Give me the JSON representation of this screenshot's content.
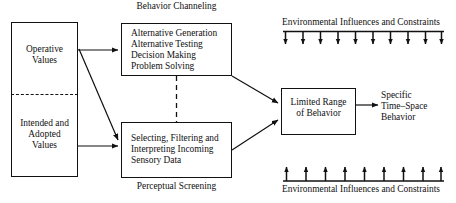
{
  "diagram": {
    "colors": {
      "stroke": "#111111",
      "background": "#ffffff",
      "text": "#111111"
    },
    "left_box": {
      "upper_label": "Operative\nValues",
      "lower_label": "Intended and\nAdopted\nValues",
      "divider": "dashed"
    },
    "top_process_box": {
      "caption": "Behavior Channeling",
      "lines": [
        "Alternative Generation",
        "Alternative Testing",
        "Decision Making",
        "Problem Solving"
      ],
      "text": "Alternative Generation\nAlternative Testing\nDecision Making\nProblem Solving"
    },
    "bottom_process_box": {
      "caption": "Perceptual Screening",
      "lines": [
        "Selecting, Filtering and",
        "Interpreting Incoming",
        "Sensory Data"
      ],
      "text": "Selecting, Filtering and\nInterpreting Incoming\nSensory Data"
    },
    "outcome_box": {
      "label": "Limited Range\nof Behavior"
    },
    "final_output": {
      "label": "Specific\nTime–Space\nBehavior"
    },
    "environment_top": {
      "label": "Environmental Influences and Constraints",
      "arrow_direction": "down",
      "arrow_count": 10
    },
    "environment_bottom": {
      "label": "Environmental Influences and Constraints",
      "arrow_direction": "up",
      "arrow_count": 9
    },
    "connectors": [
      {
        "name": "operative-to-behavior-channeling",
        "style": "solid-arrow"
      },
      {
        "name": "operative-to-perceptual-screening",
        "style": "solid-arrow-diagonal"
      },
      {
        "name": "intended-to-perceptual-screening",
        "style": "solid-arrow"
      },
      {
        "name": "behavior-channeling-to-perceptual-screening",
        "style": "dashed"
      },
      {
        "name": "behavior-channeling-to-limited-range",
        "style": "solid-arrow-diagonal"
      },
      {
        "name": "perceptual-screening-to-limited-range",
        "style": "solid-arrow-diagonal"
      },
      {
        "name": "limited-range-to-specific-behavior",
        "style": "solid-arrow"
      }
    ]
  }
}
